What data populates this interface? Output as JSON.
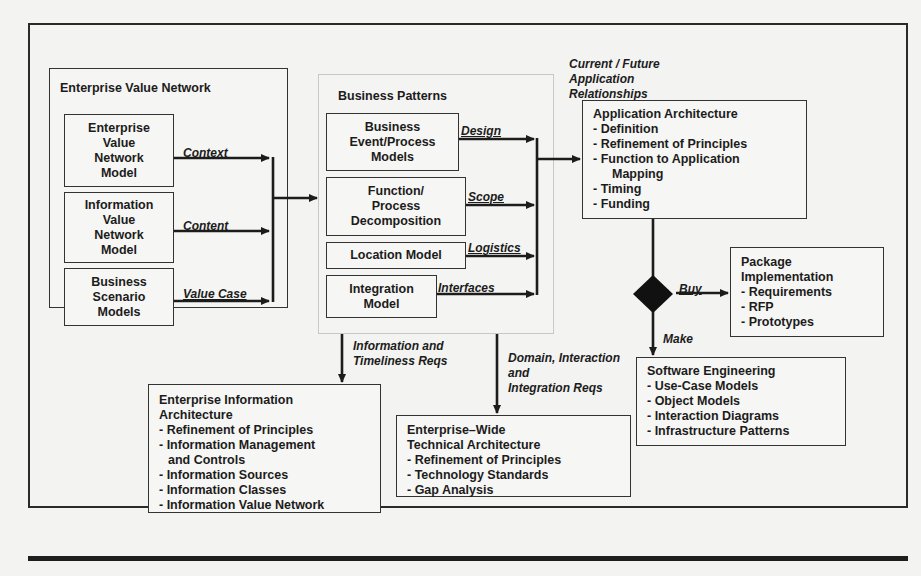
{
  "enterprise_value_network": {
    "title": "Enterprise Value Network",
    "models": [
      {
        "label": "Enterprise\nValue\nNetwork\nModel",
        "flow": "Context"
      },
      {
        "label": "Information\nValue\nNetwork\nModel",
        "flow": "Content"
      },
      {
        "label": "Business\nScenario\nModels",
        "flow": "Value Case"
      }
    ]
  },
  "business_patterns": {
    "title": "Business Patterns",
    "models": [
      {
        "label": "Business\nEvent/Process\nModels",
        "flow": "Design"
      },
      {
        "label": "Function/\nProcess\nDecomposition",
        "flow": "Scope"
      },
      {
        "label": "Location Model",
        "flow": "Logistics"
      },
      {
        "label": "Integration\nModel",
        "flow": "Interfaces"
      }
    ]
  },
  "application_relationships_label": "Current / Future\nApplication\nRelationships",
  "application_architecture": {
    "title": "Application Architecture",
    "items": [
      "- Definition",
      "- Refinement of Principles",
      "- Function to Application",
      "Mapping",
      "- Timing",
      "- Funding"
    ]
  },
  "decision": {
    "buy_label": "Buy",
    "make_label": "Make"
  },
  "package_implementation": {
    "title_line1": "Package",
    "title_line2": "Implementation",
    "items": [
      "- Requirements",
      "- RFP",
      "- Prototypes"
    ]
  },
  "software_engineering": {
    "title": "Software Engineering",
    "items": [
      "- Use-Case Models",
      "- Object Models",
      "- Interaction Diagrams",
      "- Infrastructure Patterns"
    ]
  },
  "information_timeliness_label": "Information and\nTimeliness Reqs",
  "domain_integration_label": "Domain, Interaction\nand\nIntegration Reqs",
  "enterprise_information_architecture": {
    "title_line1": "Enterprise Information",
    "title_line2": "Architecture",
    "items": [
      "- Refinement of Principles",
      "- Information Management",
      "and Controls",
      "- Information Sources",
      "- Information Classes",
      "- Information Value Network"
    ]
  },
  "enterprise_wide_technical_architecture": {
    "title_line1": "Enterprise–Wide",
    "title_line2": "Technical Architecture",
    "items": [
      "- Refinement of Principles",
      "- Technology Standards",
      "- Gap Analysis"
    ]
  },
  "colors": {
    "background": "#f3f3f1",
    "ink": "#1c1c1c",
    "faint_border": "#c8c8c6"
  }
}
